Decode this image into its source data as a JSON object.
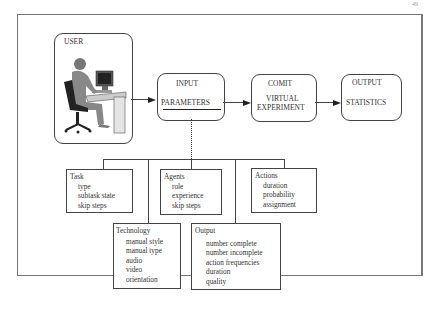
{
  "page_number": "49",
  "user_box": {
    "label": "USER",
    "image": "person-at-computer-illustration"
  },
  "flow": [
    {
      "top": "INPUT",
      "bottom": "PARAMETERS"
    },
    {
      "top": "COMIT",
      "bottom_line1": "VIRTUAL",
      "bottom_line2": "EXPERIMENT"
    },
    {
      "top": "OUTPUT",
      "bottom": "STATISTICS"
    }
  ],
  "parameter_groups": [
    {
      "title": "Task",
      "items": [
        "type",
        "subtask state",
        "skip steps"
      ]
    },
    {
      "title": "Agents",
      "items": [
        "role",
        "experience",
        "skip steps"
      ]
    },
    {
      "title": "Actions",
      "items": [
        "duration",
        "probability",
        "assignment"
      ]
    },
    {
      "title": "Technology",
      "items": [
        "manual style",
        "manual type",
        "audio",
        "video",
        "orientation"
      ]
    },
    {
      "title": "Output",
      "items": [
        "number complete",
        "number incomplete",
        "action frequencies",
        "duration",
        "quality"
      ]
    }
  ]
}
